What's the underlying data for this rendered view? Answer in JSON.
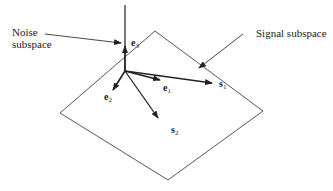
{
  "labels": {
    "noise_line1": "Noise",
    "noise_line2": "subspace",
    "signal": "Signal subspace"
  },
  "vectors": [
    {
      "name": "e",
      "sub": "1"
    },
    {
      "name": "e",
      "sub": "2"
    },
    {
      "name": "e",
      "sub": "3"
    },
    {
      "name": "s",
      "sub": "1"
    },
    {
      "name": "s",
      "sub": "2"
    }
  ],
  "colors": {
    "line": "#2a2a2a",
    "background": "#ffffff"
  }
}
